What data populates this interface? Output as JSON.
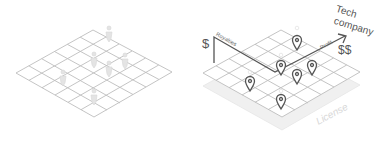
{
  "panels": {
    "left": {
      "description": "Isometric grid with people figures",
      "grid_size": 6,
      "figure_count": 7
    },
    "right": {
      "labels": {
        "dollar_left": "$",
        "royalties": "Royalties",
        "profit": "Profit",
        "tech_company": "Tech company",
        "tech": "Tech",
        "company": "company",
        "dollar_right": "$$",
        "license": "License"
      },
      "pin_count": 6
    }
  },
  "colors": {
    "grid_line": "#b9b9b9",
    "figure": "#dddddd",
    "pin": "#555555",
    "arrow": "#555555",
    "license_slab": "#eeeeee",
    "license_text": "#d8d8d8"
  }
}
